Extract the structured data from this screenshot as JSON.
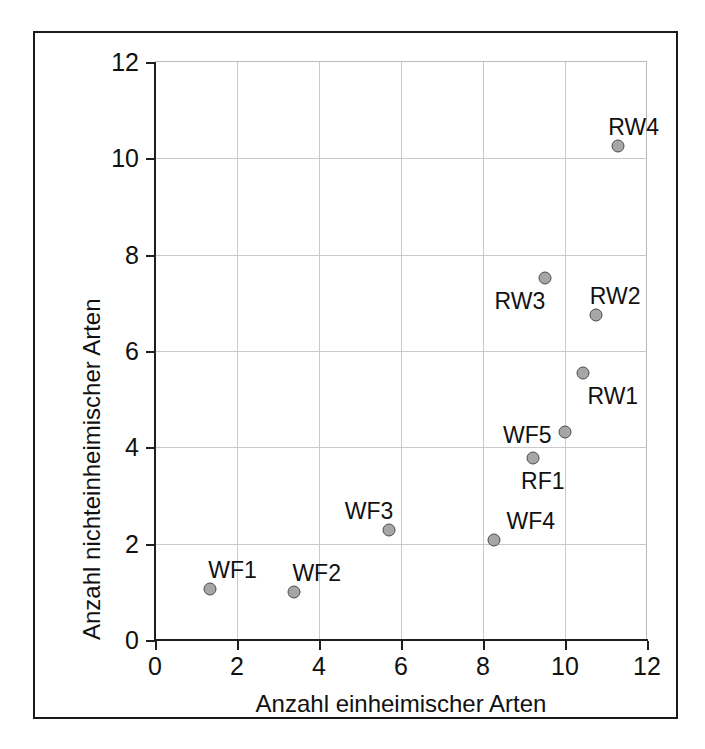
{
  "chart_data": {
    "type": "scatter",
    "title": "",
    "xlabel": "Anzahl einheimischer Arten",
    "ylabel": "Anzahl nichteinheimischer Arten",
    "xlim": [
      0,
      12
    ],
    "ylim": [
      0,
      12
    ],
    "xticks": [
      0,
      2,
      4,
      6,
      8,
      10,
      12
    ],
    "yticks": [
      0,
      2,
      4,
      6,
      8,
      10,
      12
    ],
    "xtick_labels": [
      "0",
      "2",
      "4",
      "6",
      "8",
      "10",
      "12"
    ],
    "ytick_labels": [
      "0",
      "2",
      "4",
      "6",
      "8",
      "10",
      "12"
    ],
    "grid": true,
    "legend": "none",
    "marker": {
      "shape": "circle",
      "fill_color": "#a6a6a6",
      "edge_color": "#4a4a4a"
    },
    "points": [
      {
        "label": "WF1",
        "x": 1.35,
        "y": 1.05,
        "label_dx": -2,
        "label_dy": -30
      },
      {
        "label": "WF2",
        "x": 3.4,
        "y": 1.0,
        "label_dx": -2,
        "label_dy": -30
      },
      {
        "label": "WF3",
        "x": 5.7,
        "y": 2.28,
        "label_dx": -44,
        "label_dy": -30
      },
      {
        "label": "WF4",
        "x": 8.28,
        "y": 2.07,
        "label_dx": 12,
        "label_dy": -30
      },
      {
        "label": "WF5",
        "x": 10.0,
        "y": 4.32,
        "label_dx": -62,
        "label_dy": -8
      },
      {
        "label": "RF1",
        "x": 9.22,
        "y": 3.78,
        "label_dx": -12,
        "label_dy": 12
      },
      {
        "label": "RW1",
        "x": 10.45,
        "y": 5.55,
        "label_dx": 4,
        "label_dy": 12
      },
      {
        "label": "RW2",
        "x": 10.75,
        "y": 6.75,
        "label_dx": -6,
        "label_dy": -30
      },
      {
        "label": "RW3",
        "x": 9.5,
        "y": 7.52,
        "label_dx": -50,
        "label_dy": 12
      },
      {
        "label": "RW4",
        "x": 11.3,
        "y": 10.25,
        "label_dx": -10,
        "label_dy": -30
      }
    ]
  },
  "colors": {
    "background": "#ffffff",
    "frame": "#1a1a1a",
    "axis": "#1f1f1f",
    "grid": "#c9c9c9",
    "marker_fill": "#a6a6a6",
    "marker_edge": "#4a4a4a",
    "text": "#111111"
  }
}
